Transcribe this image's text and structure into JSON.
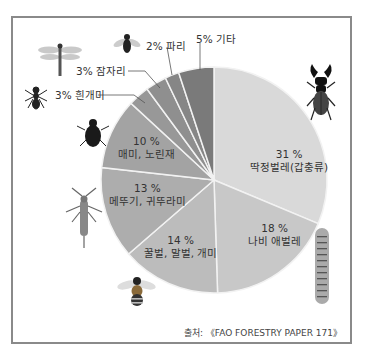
{
  "chart_data": {
    "type": "pie",
    "title": "",
    "start_angle": "12 o'clock, clockwise",
    "slices": [
      {
        "label": "딱정벌레(갑충류)",
        "value": 31,
        "color": "#d9d9d9"
      },
      {
        "label": "나비 애벌레",
        "value": 18,
        "color": "#c8c8c8"
      },
      {
        "label": "꿀벌, 말벌, 개미",
        "value": 14,
        "color": "#bcbcbc"
      },
      {
        "label": "메뚜기, 귀뚜라미",
        "value": 13,
        "color": "#adadad"
      },
      {
        "label": "매미, 노린재",
        "value": 10,
        "color": "#a3a3a3"
      },
      {
        "label": "흰개미",
        "value": 3,
        "color": "#989898"
      },
      {
        "label": "잠자리",
        "value": 3,
        "color": "#8f8f8f"
      },
      {
        "label": "파리",
        "value": 2,
        "color": "#868686"
      },
      {
        "label": "기타",
        "value": 5,
        "color": "#7a7a7a"
      }
    ]
  },
  "labels": {
    "beetle_pct": "31 %",
    "beetle_name": "딱정벌레(갑충류)",
    "butterfly_pct": "18 %",
    "butterfly_name": "나비 애벌레",
    "bee_pct": "14 %",
    "bee_name": "꿀벌, 말벌, 개미",
    "grasshopper_pct": "13 %",
    "grasshopper_name": "메뚜기, 귀뚜라미",
    "cicada_pct": "10 %",
    "cicada_name": "매미, 노린재",
    "termite": "3% 흰개미",
    "dragonfly": "3% 잠자리",
    "fly": "2% 파리",
    "other": "5% 기타"
  },
  "source": "출처: 《FAO FORESTRY PAPER 171》",
  "icons": [
    "dragonfly-icon",
    "fly-icon",
    "ant-icon",
    "housefly-icon",
    "grasshopper-icon",
    "bee-icon",
    "stag-beetle-icon",
    "caterpillar-icon"
  ]
}
